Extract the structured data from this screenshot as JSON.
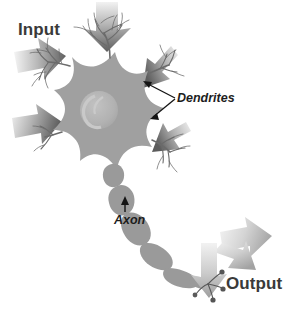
{
  "figure": {
    "width": 293,
    "height": 313,
    "background_color": "#ffffff"
  },
  "labels": {
    "input": "Input",
    "output": "Output",
    "dendrites": "Dendrites",
    "axon": "Axon"
  },
  "colors": {
    "soma_fill": "#a0a0a0",
    "nucleus_fill": "#b6b6b6",
    "nucleolus_fill": "#c4c4c4",
    "axon_fill": "#9a9a9a",
    "dendrite_stroke": "#6e6e6e",
    "input_arrow_dark": "#646464",
    "input_arrow_light": "#f2f2f2",
    "output_arrow_dark": "#b0b0b0",
    "output_arrow_light": "#f4f4f4",
    "terminal_bulb": "#5a5a5a",
    "callout_arrow": "#141414",
    "label_bold_color": "#3a3a3a",
    "label_italic_color": "#1d1d1d"
  },
  "diagram": {
    "parts": [
      {
        "name": "soma",
        "label": "Cell body (soma)"
      },
      {
        "name": "nucleus",
        "label": "Nucleus"
      },
      {
        "name": "dendrites",
        "label": "Dendrites"
      },
      {
        "name": "axon",
        "label": "Axon"
      },
      {
        "name": "myelin-segments",
        "label": "Myelin sheath segments"
      },
      {
        "name": "axon-terminals",
        "label": "Axon terminals"
      }
    ],
    "input_arrow_count": 4,
    "output_arrow_count": 3,
    "terminal_bulb_count": 4
  }
}
